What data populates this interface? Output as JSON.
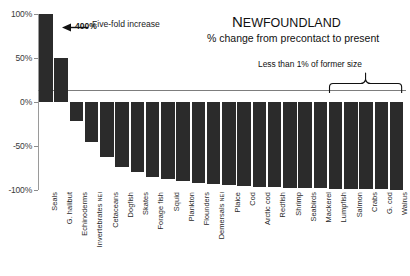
{
  "chart_data": {
    "type": "bar",
    "title": "NEWFOUNDLAND",
    "subtitle": "% change from precontact to present",
    "xlabel": "",
    "ylabel": "",
    "ylim": [
      -100,
      100
    ],
    "ytick_labels": [
      "100%",
      "50%",
      "0%",
      "-50%",
      "-100%"
    ],
    "ytick_values": [
      100,
      50,
      0,
      -50,
      -100
    ],
    "grid": false,
    "legend": "none",
    "bar_color": "#2b2b2b",
    "categories": [
      "Seals",
      "G. halibut",
      "Echinoderms",
      "Invertebrates NEI",
      "Cetaceans",
      "Dogfish",
      "Skates",
      "Forage fish",
      "Squid",
      "Plankton",
      "Flounders",
      "Demersals NEI",
      "Plaice",
      "Cod",
      "Arctic cod",
      "Redfish",
      "Shrimp",
      "Seabirds",
      "Mackerel",
      "Lumpfish",
      "Salmon",
      "Crabs",
      "G. cod",
      "Walrus"
    ],
    "values": [
      400,
      50,
      -22,
      -45,
      -62,
      -74,
      -80,
      -85,
      -88,
      -90,
      -92,
      -93,
      -94,
      -96,
      -97,
      -97,
      -98,
      -98,
      -98,
      -99,
      -99,
      -99,
      -99,
      -100
    ],
    "clipped_bars": [
      0
    ],
    "data_labels": [
      {
        "index": 0,
        "text": "400%"
      }
    ],
    "annotations": [
      {
        "name": "five-fold-increase",
        "text": "Five-fold increase",
        "target_index": 0,
        "arrow": "left"
      },
      {
        "name": "less-than-one-percent",
        "text": "Less than 1% of former size",
        "bracket_from_index": 19,
        "bracket_to_index": 23
      }
    ]
  }
}
